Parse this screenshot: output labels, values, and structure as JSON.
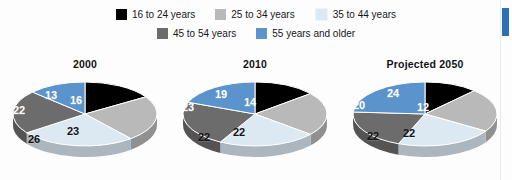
{
  "legend": {
    "rows": [
      [
        {
          "label": "16 to 24 years",
          "color": "#000000",
          "swatch_name": "legend-swatch-16-24"
        },
        {
          "label": "25 to 34 years",
          "color": "#b9b9b9",
          "swatch_name": "legend-swatch-25-34"
        },
        {
          "label": "35 to 44 years",
          "color": "#dce9f3",
          "swatch_name": "legend-swatch-35-44"
        }
      ],
      [
        {
          "label": "45 to 54 years",
          "color": "#6c6c6c",
          "swatch_name": "legend-swatch-45-54"
        },
        {
          "label": "55 years and older",
          "color": "#5b93cc",
          "swatch_name": "legend-swatch-55-plus"
        }
      ]
    ]
  },
  "colors": {
    "age_16_24": "#000000",
    "age_25_34": "#b9b9b9",
    "age_35_44": "#dce9f3",
    "age_45_54": "#6c6c6c",
    "age_55_plus": "#5b93cc",
    "accent_bar": "#2c6fb5",
    "background": "#fdfdfd"
  },
  "chart_data": {
    "type": "pie",
    "title": "",
    "legend_position": "top",
    "categories": [
      "16 to 24 years",
      "25 to 34 years",
      "35 to 44 years",
      "45 to 54 years",
      "55 years and older"
    ],
    "category_colors": [
      "#000000",
      "#b9b9b9",
      "#dce9f3",
      "#6c6c6c",
      "#5b93cc"
    ],
    "unit": "percent",
    "charts": [
      {
        "title": "2000",
        "values": [
          16,
          23,
          26,
          22,
          13
        ],
        "slices": [
          {
            "label": "16",
            "category": "16 to 24 years",
            "value": 16,
            "color": "#000000",
            "text_color": "#ffffff",
            "lx": 69,
            "ly": 26
          },
          {
            "label": "23",
            "category": "25 to 34 years",
            "value": 23,
            "color": "#b9b9b9",
            "text_color": "#141414",
            "lx": 66,
            "ly": 57
          },
          {
            "label": "26",
            "category": "35 to 44 years",
            "value": 26,
            "color": "#dce9f3",
            "text_color": "#141414",
            "lx": 27,
            "ly": 65
          },
          {
            "label": "22",
            "category": "45 to 54 years",
            "value": 22,
            "color": "#6c6c6c",
            "text_color": "#ffffff",
            "lx": 12,
            "ly": 36
          },
          {
            "label": "13",
            "category": "55 years and older",
            "value": 13,
            "color": "#5b93cc",
            "text_color": "#ffffff",
            "lx": 44,
            "ly": 21
          }
        ]
      },
      {
        "title": "2010",
        "values": [
          14,
          22,
          22,
          23,
          19
        ],
        "slices": [
          {
            "label": "14",
            "category": "16 to 24 years",
            "value": 14,
            "color": "#000000",
            "text_color": "#ffffff",
            "lx": 73,
            "ly": 28
          },
          {
            "label": "22",
            "category": "25 to 34 years",
            "value": 22,
            "color": "#b9b9b9",
            "text_color": "#141414",
            "lx": 62,
            "ly": 58
          },
          {
            "label": "22",
            "category": "35 to 44 years",
            "value": 22,
            "color": "#dce9f3",
            "text_color": "#141414",
            "lx": 27,
            "ly": 63
          },
          {
            "label": "23",
            "category": "45 to 54 years",
            "value": 23,
            "color": "#6c6c6c",
            "text_color": "#ffffff",
            "lx": 11,
            "ly": 33
          },
          {
            "label": "19",
            "category": "55 years and older",
            "value": 19,
            "color": "#5b93cc",
            "text_color": "#ffffff",
            "lx": 44,
            "ly": 20
          }
        ]
      },
      {
        "title": "Projected 2050",
        "values": [
          12,
          22,
          22,
          20,
          24
        ],
        "slices": [
          {
            "label": "12",
            "category": "16 to 24 years",
            "value": 12,
            "color": "#000000",
            "text_color": "#ffffff",
            "lx": 76,
            "ly": 33
          },
          {
            "label": "22",
            "category": "25 to 34 years",
            "value": 22,
            "color": "#b9b9b9",
            "text_color": "#141414",
            "lx": 62,
            "ly": 59
          },
          {
            "label": "22",
            "category": "35 to 44 years",
            "value": 22,
            "color": "#dce9f3",
            "text_color": "#141414",
            "lx": 26,
            "ly": 62
          },
          {
            "label": "20",
            "category": "45 to 54 years",
            "value": 20,
            "color": "#6c6c6c",
            "text_color": "#ffffff",
            "lx": 12,
            "ly": 31
          },
          {
            "label": "24",
            "category": "55 years and older",
            "value": 24,
            "color": "#5b93cc",
            "text_color": "#ffffff",
            "lx": 46,
            "ly": 19
          }
        ]
      }
    ]
  }
}
